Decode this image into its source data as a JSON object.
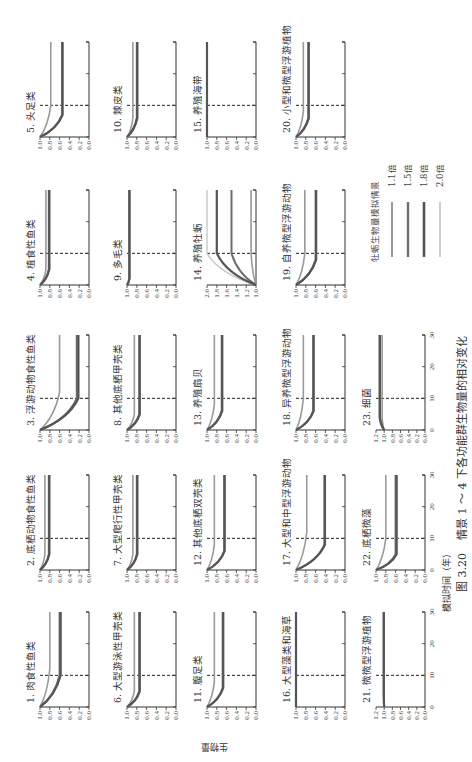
{
  "figure": {
    "caption_number": "图 3.20",
    "caption_text": "情景 1 ～ 4 下各功能群生物量的相对变化",
    "xlabel": "模拟时间（年）",
    "ylabel": "生物量",
    "legend": {
      "title": "牡蛎生物量模拟情景",
      "entries": [
        {
          "label": "1.1倍",
          "color": "#9a9a9a",
          "width": 1.6
        },
        {
          "label": "1.5倍",
          "color": "#6e6e6e",
          "width": 2.0
        },
        {
          "label": "1.8倍",
          "color": "#555555",
          "width": 2.2
        },
        {
          "label": "2.0倍",
          "color": "#c8c8c8",
          "width": 1.4
        }
      ]
    }
  },
  "chart_data": {
    "type": "line",
    "title": "情景 1 ～ 4 下各功能群生物量的相对变化",
    "xlabel": "模拟时间（年）",
    "ylabel": "生物量",
    "x_ticks": [
      0,
      10,
      20,
      30
    ],
    "xlim": [
      0,
      30
    ],
    "reference_line_x": 10,
    "series_names": [
      "1.1倍",
      "1.5倍",
      "1.8倍",
      "2.0倍"
    ],
    "panels": [
      {
        "id": 1,
        "title": "1. 肉食性鱼类",
        "ylim": [
          0,
          1
        ],
        "yticks": [
          "1.0",
          "0.8",
          "0.6",
          "0.4",
          "0.2",
          "0.0"
        ],
        "final": [
          0.8,
          0.6,
          0.58,
          0.57
        ],
        "knee": [
          12,
          10,
          10,
          10
        ]
      },
      {
        "id": 2,
        "title": "2. 底栖动物食性鱼类",
        "ylim": [
          0,
          1
        ],
        "yticks": [
          "1.0",
          "0.8",
          "0.6",
          "0.4",
          "0.2",
          "0.0"
        ],
        "final": [
          0.9,
          0.82,
          0.81,
          0.8
        ],
        "knee": [
          5,
          5,
          5,
          5
        ]
      },
      {
        "id": 3,
        "title": "3. 浮游动物食性鱼类",
        "ylim": [
          0,
          1
        ],
        "yticks": [
          "1.0",
          "0.8",
          "0.6",
          "0.4",
          "0.2",
          "0.0"
        ],
        "final": [
          0.6,
          0.25,
          0.22,
          0.2
        ],
        "knee": [
          12,
          10,
          10,
          10
        ]
      },
      {
        "id": 4,
        "title": "4. 植食性鱼类",
        "ylim": [
          0,
          1
        ],
        "yticks": [
          "1.0",
          "0.8",
          "0.6",
          "0.4",
          "0.2",
          "0.0"
        ],
        "final": [
          0.88,
          0.82,
          0.81,
          0.8
        ],
        "knee": [
          5,
          5,
          5,
          5
        ]
      },
      {
        "id": 5,
        "title": "5. 头足类",
        "ylim": [
          0,
          1
        ],
        "yticks": [
          "1.0",
          "0.8",
          "0.6",
          "0.4",
          "0.2",
          "0.0"
        ],
        "final": [
          0.78,
          0.55,
          0.54,
          0.53
        ],
        "knee": [
          10,
          7,
          7,
          7
        ]
      },
      {
        "id": 6,
        "title": "6. 大型游泳性甲壳类",
        "ylim": [
          0,
          1
        ],
        "yticks": [
          "1.0",
          "0.8",
          "0.6",
          "0.4",
          "0.2",
          "0.0"
        ],
        "final": [
          0.85,
          0.75,
          0.74,
          0.73
        ],
        "knee": [
          5,
          5,
          5,
          5
        ]
      },
      {
        "id": 7,
        "title": "7. 大型爬行性甲壳类",
        "ylim": [
          0,
          1
        ],
        "yticks": [
          "1.0",
          "0.8",
          "0.6",
          "0.4",
          "0.2",
          "0.0"
        ],
        "final": [
          0.88,
          0.8,
          0.79,
          0.78
        ],
        "knee": [
          5,
          5,
          5,
          5
        ]
      },
      {
        "id": 8,
        "title": "8. 其他底栖甲壳类",
        "ylim": [
          0,
          1
        ],
        "yticks": [
          "1.0",
          "0.8",
          "0.6",
          "0.4",
          "0.2",
          "0.0"
        ],
        "final": [
          0.85,
          0.75,
          0.74,
          0.73
        ],
        "knee": [
          5,
          5,
          5,
          5
        ]
      },
      {
        "id": 9,
        "title": "9. 多毛类",
        "ylim": [
          0,
          1
        ],
        "yticks": [
          "1.0",
          "0.8",
          "0.6",
          "0.4",
          "0.2",
          "0.0"
        ],
        "final": [
          0.96,
          0.95,
          0.95,
          0.95
        ],
        "knee": [
          2,
          2,
          2,
          2
        ]
      },
      {
        "id": 10,
        "title": "10. 棘皮类",
        "ylim": [
          0,
          1
        ],
        "yticks": [
          "1.0",
          "0.8",
          "0.6",
          "0.4",
          "0.2",
          "0.0"
        ],
        "final": [
          0.88,
          0.8,
          0.79,
          0.78
        ],
        "knee": [
          6,
          6,
          6,
          6
        ]
      },
      {
        "id": 11,
        "title": "11. 腹足类",
        "ylim": [
          0,
          1
        ],
        "yticks": [
          "1.0",
          "0.8",
          "0.6",
          "0.4",
          "0.2",
          "0.0"
        ],
        "final": [
          0.85,
          0.68,
          0.67,
          0.66
        ],
        "knee": [
          8,
          6,
          6,
          6
        ]
      },
      {
        "id": 12,
        "title": "12. 其他底栖双壳类",
        "ylim": [
          0,
          1
        ],
        "yticks": [
          "1.0",
          "0.8",
          "0.6",
          "0.4",
          "0.2",
          "0.0"
        ],
        "final": [
          0.85,
          0.65,
          0.64,
          0.63
        ],
        "knee": [
          8,
          6,
          6,
          6
        ]
      },
      {
        "id": 13,
        "title": "13. 养殖扇贝",
        "ylim": [
          0,
          1
        ],
        "yticks": [
          "1.0",
          "0.8",
          "0.6",
          "0.4",
          "0.2",
          "0.0"
        ],
        "final": [
          0.85,
          0.7,
          0.69,
          0.68
        ],
        "knee": [
          8,
          6,
          6,
          6
        ]
      },
      {
        "id": 14,
        "title": "14. 养殖牡蛎",
        "ylim": [
          1,
          2
        ],
        "yticks": [
          "2.0",
          "1.8",
          "1.6",
          "1.4",
          "1.2",
          "1.0"
        ],
        "final": [
          1.1,
          1.5,
          1.8,
          2.0
        ],
        "knee": [
          10,
          10,
          10,
          10
        ]
      },
      {
        "id": 15,
        "title": "15. 养殖海带",
        "ylim": [
          0,
          1
        ],
        "yticks": [
          "1.0",
          "0.8",
          "0.6",
          "0.4",
          "0.2",
          "0.0"
        ],
        "final": [
          1.0,
          1.0,
          1.0,
          1.0
        ],
        "knee": [
          0,
          0,
          0,
          0
        ]
      },
      {
        "id": 16,
        "title": "16. 大型藻类和海草",
        "ylim": [
          0,
          1
        ],
        "yticks": [
          "1.0",
          "0.8",
          "0.6",
          "0.4",
          "0.2",
          "0.0"
        ],
        "final": [
          1.0,
          1.0,
          1.0,
          1.0
        ],
        "knee": [
          0,
          0,
          0,
          0
        ]
      },
      {
        "id": 17,
        "title": "17. 大型和中型浮游动物",
        "ylim": [
          0,
          1
        ],
        "yticks": [
          "1.0",
          "0.8",
          "0.6",
          "0.4",
          "0.2",
          "0.0"
        ],
        "final": [
          0.78,
          0.42,
          0.41,
          0.4
        ],
        "knee": [
          12,
          8,
          8,
          8
        ]
      },
      {
        "id": 18,
        "title": "18. 异养微型浮游动物",
        "ylim": [
          0,
          1
        ],
        "yticks": [
          "1.0",
          "0.8",
          "0.6",
          "0.4",
          "0.2",
          "0.0"
        ],
        "final": [
          0.85,
          0.65,
          0.64,
          0.63
        ],
        "knee": [
          10,
          6,
          6,
          6
        ]
      },
      {
        "id": 19,
        "title": "19. 自养微型浮游动物",
        "ylim": [
          0,
          1
        ],
        "yticks": [
          "1.0",
          "0.8",
          "0.6",
          "0.4",
          "0.2",
          "0.0"
        ],
        "final": [
          0.82,
          0.6,
          0.59,
          0.58
        ],
        "knee": [
          10,
          8,
          8,
          8
        ]
      },
      {
        "id": 20,
        "title": "20. 小型和微型浮游植物",
        "ylim": [
          0,
          1
        ],
        "yticks": [
          "1.0",
          "0.8",
          "0.6",
          "0.4",
          "0.2",
          "0.0"
        ],
        "final": [
          0.85,
          0.75,
          0.74,
          0.73
        ],
        "knee": [
          8,
          6,
          6,
          6
        ]
      },
      {
        "id": 21,
        "title": "21. 微微型浮游植物",
        "ylim": [
          0,
          1.2
        ],
        "yticks": [
          "1.2",
          "1.0",
          "0.8",
          "0.6",
          "0.4",
          "0.2",
          "0.0"
        ],
        "final": [
          1.0,
          1.01,
          1.01,
          1.0
        ],
        "knee": [
          4,
          4,
          4,
          4
        ]
      },
      {
        "id": 22,
        "title": "22. 底栖微藻",
        "ylim": [
          0,
          1
        ],
        "yticks": [
          "1.0",
          "0.8",
          "0.6",
          "0.4",
          "0.2",
          "0.0"
        ],
        "final": [
          0.8,
          0.6,
          0.58,
          0.57
        ],
        "knee": [
          10,
          5,
          5,
          5
        ]
      },
      {
        "id": 23,
        "title": "23. 细菌",
        "ylim": [
          0,
          1.2
        ],
        "yticks": [
          "1.2",
          "1.0",
          "0.8",
          "0.6",
          "0.4",
          "0.2",
          "0.0"
        ],
        "final": [
          1.05,
          1.1,
          1.11,
          1.12
        ],
        "knee": [
          4,
          4,
          4,
          4
        ]
      }
    ]
  }
}
